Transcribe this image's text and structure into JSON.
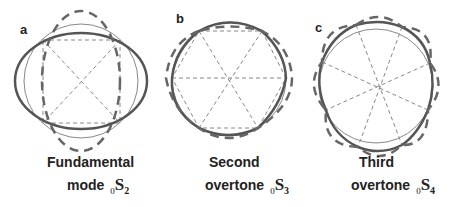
{
  "panels": [
    {
      "letter": "a",
      "caption_line1": "Fundamental",
      "caption_line2": "mode",
      "mode_prefix": "0",
      "mode_letter": "S",
      "mode_sub": "2",
      "polygon_sides": 4
    },
    {
      "letter": "b",
      "caption_line1": "Second",
      "caption_line2": "overtone",
      "mode_prefix": "0",
      "mode_letter": "S",
      "mode_sub": "3",
      "polygon_sides": 6
    },
    {
      "letter": "c",
      "caption_line1": "Third",
      "caption_line2": "overtone",
      "mode_prefix": "0",
      "mode_letter": "S",
      "mode_sub": "4",
      "polygon_sides": 8
    }
  ],
  "colors": {
    "solid_line": "#555555",
    "dashed_line": "#666666",
    "thin_circle": "#888888",
    "guide_line": "#888888",
    "text": "#222222"
  }
}
